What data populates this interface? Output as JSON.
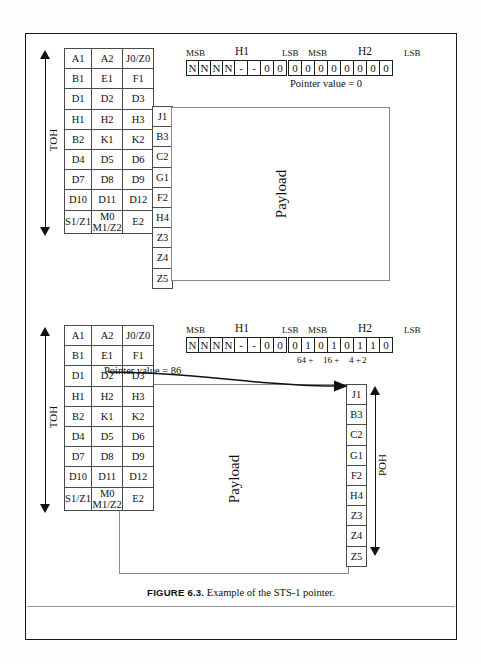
{
  "figure": {
    "number": "FIGURE 6.3.",
    "caption": "Example of the STS-1 pointer."
  },
  "labels": {
    "toh": "TOH",
    "poh": "POH",
    "payload": "Payload",
    "msb": "MSB",
    "lsb": "LSB",
    "h1": "H1",
    "h2": "H2"
  },
  "toh_grid": {
    "rows": [
      [
        {
          "text": "A1",
          "style": "normal"
        },
        {
          "text": "A2",
          "style": "normal"
        },
        {
          "text": "J0/Z0",
          "style": "tiny"
        }
      ],
      [
        {
          "text": "B1",
          "style": "normal"
        },
        {
          "text": "E1",
          "style": "normal"
        },
        {
          "text": "F1",
          "style": "normal"
        }
      ],
      [
        {
          "text": "D1",
          "style": "normal"
        },
        {
          "text": "D2",
          "style": "normal"
        },
        {
          "text": "D3",
          "style": "normal"
        }
      ],
      [
        {
          "text": "H1",
          "style": "normal"
        },
        {
          "text": "H2",
          "style": "normal"
        },
        {
          "text": "H3",
          "style": "normal"
        }
      ],
      [
        {
          "text": "B2",
          "style": "normal"
        },
        {
          "text": "K1",
          "style": "normal"
        },
        {
          "text": "K2",
          "style": "normal"
        }
      ],
      [
        {
          "text": "D4",
          "style": "normal"
        },
        {
          "text": "D5",
          "style": "normal"
        },
        {
          "text": "D6",
          "style": "normal"
        }
      ],
      [
        {
          "text": "D7",
          "style": "normal"
        },
        {
          "text": "D8",
          "style": "normal"
        },
        {
          "text": "D9",
          "style": "normal"
        }
      ],
      [
        {
          "text": "D10",
          "style": "normal"
        },
        {
          "text": "D11",
          "style": "normal"
        },
        {
          "text": "D12",
          "style": "normal"
        }
      ],
      [
        {
          "text": "S1/Z1",
          "style": "tiny"
        },
        {
          "text": "M0\nM1/Z2",
          "style": "stack"
        },
        {
          "text": "E2",
          "style": "normal"
        }
      ]
    ]
  },
  "poh_column": {
    "cells": [
      "J1",
      "B3",
      "C2",
      "G1",
      "F2",
      "H4",
      "Z3",
      "Z4",
      "Z5"
    ]
  },
  "pointer_top": {
    "bits": [
      "N",
      "N",
      "N",
      "N",
      "-",
      "-",
      "0",
      "0",
      "0",
      "0",
      "0",
      "0",
      "0",
      "0",
      "0",
      "0"
    ],
    "value_text": "Pointer value = 0",
    "weights": []
  },
  "pointer_bottom": {
    "bits": [
      "N",
      "N",
      "N",
      "N",
      "-",
      "-",
      "0",
      "0",
      "0",
      "1",
      "0",
      "1",
      "0",
      "1",
      "1",
      "0"
    ],
    "value_text": "Pointer value = 86",
    "weights": [
      {
        "text": "64 +",
        "bit_index": 9
      },
      {
        "text": "16 +",
        "bit_index": 11
      },
      {
        "text": "4 +",
        "bit_index": 13
      },
      {
        "text": "2",
        "bit_index": 14
      }
    ]
  }
}
